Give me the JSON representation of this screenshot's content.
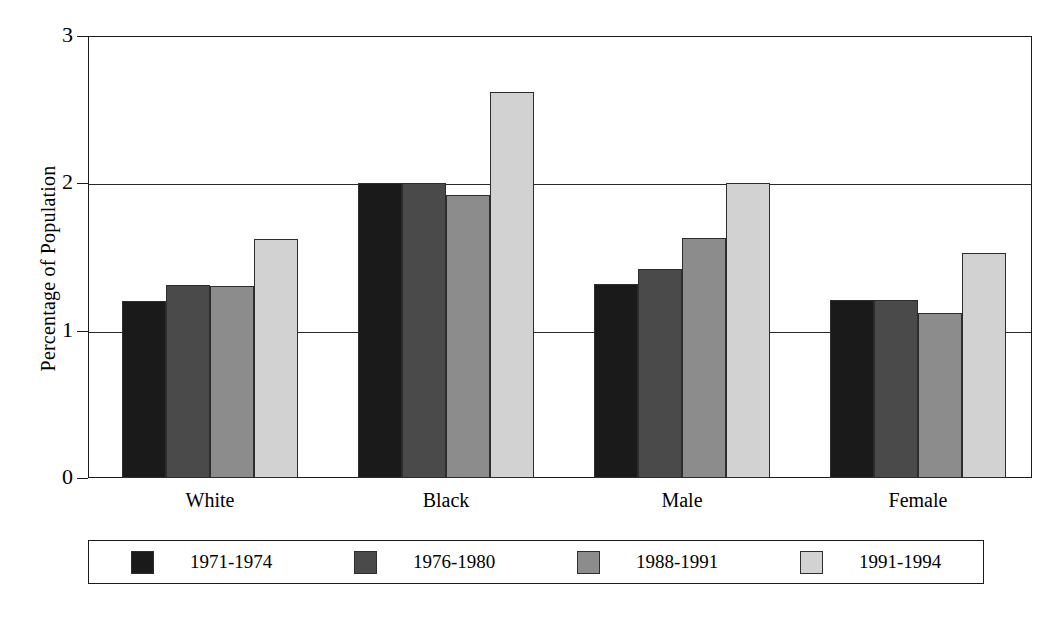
{
  "chart_data": {
    "type": "bar",
    "title": "",
    "xlabel": "",
    "ylabel": "Percentage of Population",
    "categories": [
      "White",
      "Black",
      "Male",
      "Female"
    ],
    "series": [
      {
        "name": "1971-1974",
        "color": "#1a1a1a",
        "values": [
          1.2,
          2.0,
          1.32,
          1.21
        ]
      },
      {
        "name": "1976-1980",
        "color": "#4a4a4a",
        "values": [
          1.31,
          2.0,
          1.42,
          1.21
        ]
      },
      {
        "name": "1988-1991",
        "color": "#8c8c8c",
        "values": [
          1.3,
          1.92,
          1.63,
          1.12
        ]
      },
      {
        "name": "1991-1994",
        "color": "#d2d2d2",
        "values": [
          1.62,
          2.62,
          2.0,
          1.53
        ]
      }
    ],
    "ylim": [
      0,
      3
    ],
    "yticks": [
      0,
      1,
      2,
      3
    ],
    "ytick_labels": [
      "0",
      "1",
      "2",
      "3"
    ],
    "gridlines": [
      1,
      2
    ],
    "grid": true,
    "legend_position": "bottom",
    "bar_outline_color": "#2d2d2d",
    "axis_color": "#1b1b1b"
  },
  "axis": {
    "y_title": "Percentage of Population"
  }
}
